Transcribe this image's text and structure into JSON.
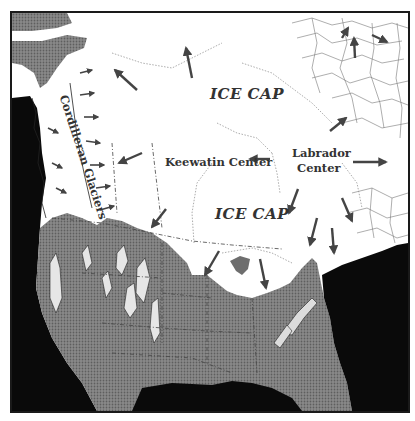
{
  "map": {
    "title": "Ice sheets over North America",
    "labels": {
      "ice_cap_north": "ICE CAP",
      "ice_cap_south": "ICE CAP",
      "keewatin_center": "Keewatin Center",
      "labrador_center_line1": "Labrador",
      "labrador_center_line2": "Center",
      "cordilleran_glaciers": "Cordilleran Glaciers"
    },
    "legend_colors": {
      "ice": "#ffffff",
      "land": "#7a7a7a",
      "ocean": "#0a0a0a",
      "mountain_highlight": "#e8e8e8",
      "arrow": "#4a4a4a"
    },
    "features": [
      "ice-cap",
      "keewatin-center",
      "labrador-center",
      "cordilleran-glaciers",
      "ice-flow-arrows",
      "state-borders",
      "ocean",
      "great-lakes-proto"
    ]
  }
}
